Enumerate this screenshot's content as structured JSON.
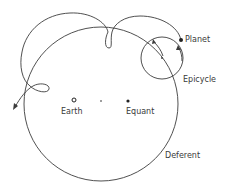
{
  "diagram": {
    "labels": {
      "planet": "Planet",
      "epicycle": "Epicycle",
      "earth": "Earth",
      "equant": "Equant",
      "deferent": "Deferent"
    },
    "colors": {
      "stroke": "#3c3c3c",
      "text": "#3a3a3a",
      "background": "#ffffff"
    }
  }
}
